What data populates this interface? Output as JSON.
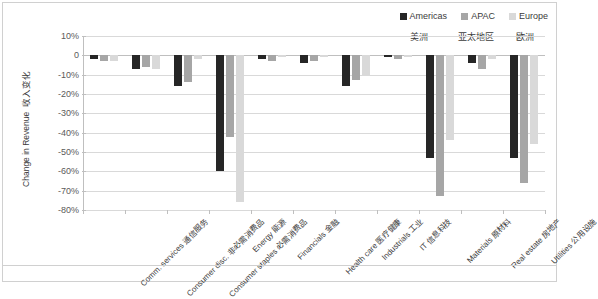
{
  "legend": {
    "items": [
      {
        "label": "Americas",
        "color": "#262626",
        "cn": "美洲"
      },
      {
        "label": "APAC",
        "color": "#a6a6a6",
        "cn": "亚太地区"
      },
      {
        "label": "Europe",
        "color": "#d9d9d9",
        "cn": "欧洲"
      }
    ]
  },
  "axis": {
    "ylabel_en": "Change in Revenue",
    "ylabel_cn": "收入变化",
    "yticks": [
      "10%",
      "0",
      "-10%",
      "-20%",
      "-30%",
      "-40%",
      "-50%",
      "-60%",
      "-70%",
      "-80%"
    ]
  },
  "chart_data": {
    "type": "bar",
    "title": "",
    "xlabel": "",
    "ylabel": "Change in Revenue 收入变化",
    "ylim": [
      -80,
      10
    ],
    "ytick_values": [
      10,
      0,
      -10,
      -20,
      -30,
      -40,
      -50,
      -60,
      -70,
      -80
    ],
    "grid": true,
    "legend_position": "top-right",
    "categories": [
      "Comm. services",
      "Consumer disc.",
      "Consumer staples",
      "Energy",
      "Financials",
      "Health care",
      "Industrials",
      "IT",
      "Materials",
      "Real estate",
      "Utilities"
    ],
    "categories_cn": [
      "通信服务",
      "非必需消费品",
      "必需消费品",
      "能源",
      "金融",
      "医疗健康",
      "工业",
      "信息科技",
      "原材料",
      "房地产",
      "公用设施"
    ],
    "series": [
      {
        "name": "Americas",
        "color": "#262626",
        "values": [
          -2,
          -7,
          -16,
          -60,
          -2,
          -4,
          -16,
          -1,
          -53,
          -4,
          -53
        ]
      },
      {
        "name": "APAC",
        "color": "#a6a6a6",
        "values": [
          -3,
          -6,
          -14,
          -42,
          -3,
          -3,
          -13,
          -2,
          -73,
          -7,
          -66
        ]
      },
      {
        "name": "Europe",
        "color": "#d9d9d9",
        "values": [
          -3,
          -7,
          -2,
          -76,
          -1,
          -1,
          -10,
          -1,
          -44,
          -2,
          -46
        ]
      }
    ]
  }
}
